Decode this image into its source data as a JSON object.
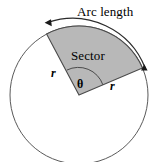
{
  "figure": {
    "type": "geometry-diagram",
    "background_color": "#ffffff",
    "stroke_color": "#3a3a3a",
    "sector_fill_color": "#b8b8b8",
    "sector_stroke_color": "#4a4a4a",
    "labels": {
      "arc_length": "Arc length",
      "sector": "Sector",
      "radius_left": "r",
      "radius_right": "r",
      "angle": "θ"
    },
    "geometry": {
      "circle_center_x": 79,
      "circle_center_y": 95,
      "circle_radius": 69,
      "sector_start_angle_deg": 23,
      "sector_end_angle_deg": 118,
      "angle_arc_radius": 26,
      "arrow_arc_radius": 78,
      "arrow_start_angle_deg": 20,
      "arrow_end_angle_deg": 122
    }
  }
}
